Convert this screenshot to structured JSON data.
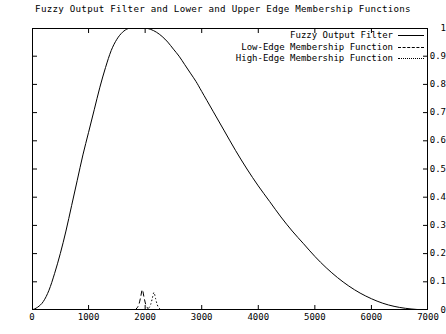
{
  "chart_data": {
    "type": "line",
    "title": "Fuzzy Output Filter and Lower and Upper Edge Membership Functions",
    "xlabel": "",
    "ylabel": "",
    "xlim": [
      0,
      7000
    ],
    "ylim": [
      0,
      1
    ],
    "xticks": [
      0,
      1000,
      2000,
      3000,
      4000,
      5000,
      6000,
      7000
    ],
    "yticks": [
      0,
      0.1,
      0.2,
      0.3,
      0.4,
      0.5,
      0.6,
      0.7,
      0.8,
      0.9,
      1
    ],
    "grid": false,
    "legend_position": "top-right",
    "series": [
      {
        "name": "Fuzzy Output Filter",
        "style": "solid",
        "color": "#000000",
        "x": [
          0,
          100,
          200,
          300,
          400,
          500,
          600,
          700,
          800,
          900,
          1000,
          1100,
          1200,
          1300,
          1400,
          1500,
          1600,
          1700,
          1800,
          1900,
          2000,
          2100,
          2200,
          2300,
          2400,
          2500,
          2600,
          2700,
          2800,
          2900,
          3000,
          3200,
          3400,
          3600,
          3800,
          4000,
          4200,
          4400,
          4600,
          4800,
          5000,
          5200,
          5400,
          5600,
          5800,
          6000,
          6200,
          6400,
          6600,
          6800,
          7000
        ],
        "y": [
          0.0,
          0.01,
          0.03,
          0.07,
          0.13,
          0.2,
          0.28,
          0.37,
          0.46,
          0.55,
          0.63,
          0.71,
          0.79,
          0.86,
          0.92,
          0.96,
          0.985,
          0.998,
          1.0,
          1.0,
          1.0,
          0.995,
          0.985,
          0.97,
          0.95,
          0.925,
          0.9,
          0.87,
          0.84,
          0.81,
          0.775,
          0.705,
          0.635,
          0.565,
          0.5,
          0.44,
          0.385,
          0.33,
          0.28,
          0.235,
          0.19,
          0.15,
          0.115,
          0.085,
          0.06,
          0.04,
          0.024,
          0.013,
          0.006,
          0.002,
          0.0
        ]
      },
      {
        "name": "Low-Edge Membership Function",
        "style": "dashed",
        "color": "#000000",
        "x": [
          1820,
          1860,
          1890,
          1920,
          1950,
          1980,
          2010,
          2040,
          2070
        ],
        "y": [
          0.0,
          0.008,
          0.02,
          0.045,
          0.072,
          0.045,
          0.02,
          0.008,
          0.0
        ]
      },
      {
        "name": "High-Edge Membership Function",
        "style": "dotted",
        "color": "#000000",
        "x": [
          2020,
          2060,
          2095,
          2125,
          2155,
          2185,
          2215,
          2250,
          2290
        ],
        "y": [
          0.0,
          0.006,
          0.018,
          0.04,
          0.062,
          0.04,
          0.018,
          0.006,
          0.0
        ]
      }
    ]
  },
  "legend": {
    "items": [
      {
        "label": "Fuzzy Output Filter",
        "style": "solid"
      },
      {
        "label": "Low-Edge Membership Function",
        "style": "dashed"
      },
      {
        "label": "High-Edge Membership Function",
        "style": "dotted"
      }
    ]
  },
  "axes": {
    "y_labels": [
      "1",
      "0.9",
      "0.8",
      "0.7",
      "0.6",
      "0.5",
      "0.4",
      "0.3",
      "0.2",
      "0.1",
      "0"
    ],
    "x_labels": [
      "0",
      "1000",
      "2000",
      "3000",
      "4000",
      "5000",
      "6000",
      "7000"
    ]
  }
}
